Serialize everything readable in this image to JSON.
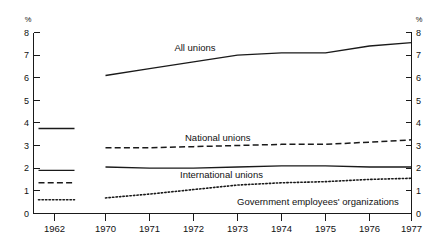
{
  "chart_data": {
    "type": "line",
    "title": "",
    "xlabel": "",
    "ylabel": "%",
    "ylabel_right": "%",
    "ylim": [
      0,
      8
    ],
    "yticks": [
      0,
      1,
      2,
      3,
      4,
      5,
      6,
      7,
      8
    ],
    "ytick_labels": [
      "0",
      "1",
      "2",
      "3",
      "4",
      "5",
      "6",
      "7",
      "8"
    ],
    "grid": false,
    "legend_position": "inline-annotations",
    "xticks": [
      1962,
      1970,
      1971,
      1972,
      1973,
      1974,
      1975,
      1976,
      1977
    ],
    "xtick_labels": [
      "1962",
      "1970",
      "1971",
      "1972",
      "1973",
      "1974",
      "1975",
      "1976",
      "1977"
    ],
    "note": "1962 values drawn as short isolated segments detached from the 1970-1977 continuous series",
    "series": [
      {
        "name": "All unions",
        "style": "solid",
        "color": "#1a1a1a",
        "label": "All unions",
        "value_1962": 3.75,
        "x": [
          1970,
          1971,
          1972,
          1973,
          1974,
          1975,
          1976,
          1977
        ],
        "values": [
          6.1,
          6.4,
          6.7,
          7.0,
          7.1,
          7.1,
          7.4,
          7.55
        ]
      },
      {
        "name": "National unions",
        "style": "dashed",
        "color": "#1a1a1a",
        "label": "National unions",
        "value_1962": 1.35,
        "x": [
          1970,
          1971,
          1972,
          1973,
          1974,
          1975,
          1976,
          1977
        ],
        "values": [
          2.9,
          2.9,
          2.95,
          3.0,
          3.05,
          3.05,
          3.15,
          3.25
        ]
      },
      {
        "name": "International unions",
        "style": "solid",
        "color": "#1a1a1a",
        "label": "International unions",
        "value_1962": 1.9,
        "x": [
          1970,
          1971,
          1972,
          1973,
          1974,
          1975,
          1976,
          1977
        ],
        "values": [
          2.05,
          2.0,
          2.0,
          2.05,
          2.1,
          2.1,
          2.05,
          2.05
        ]
      },
      {
        "name": "Government employees' organizations",
        "style": "dotted",
        "color": "#1a1a1a",
        "label": "Government employees' organizations",
        "value_1962": 0.6,
        "x": [
          1970,
          1971,
          1972,
          1973,
          1974,
          1975,
          1976,
          1977
        ],
        "values": [
          0.68,
          0.85,
          1.05,
          1.25,
          1.35,
          1.4,
          1.5,
          1.55
        ]
      }
    ],
    "annotations": [
      {
        "id": "all-unions",
        "text": "All unions",
        "x_px": 195,
        "y_px": 51
      },
      {
        "id": "national-unions",
        "text": "National unions",
        "x_px": 185,
        "y_px": 141
      },
      {
        "id": "international-unions",
        "text": "International unions",
        "x_px": 180,
        "y_px": 178
      },
      {
        "id": "government-employees",
        "text": "Government employees' organizations",
        "x_px": 237,
        "y_px": 205
      }
    ]
  }
}
